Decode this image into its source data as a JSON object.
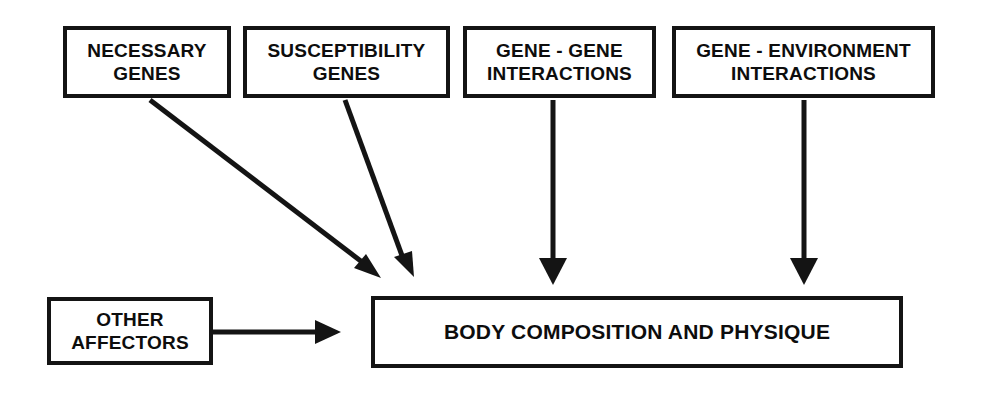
{
  "diagram": {
    "colors": {
      "stroke": "#141414",
      "text": "#0d0d0d",
      "background": "#ffffff"
    },
    "nodes": {
      "necessary_genes": {
        "label": "NECESSARY\nGENES"
      },
      "susceptibility_genes": {
        "label": "SUSCEPTIBILITY\nGENES"
      },
      "gene_gene_interactions": {
        "label": "GENE - GENE\nINTERACTIONS"
      },
      "gene_environment_interactions": {
        "label": "GENE - ENVIRONMENT\nINTERACTIONS"
      },
      "other_affectors": {
        "label": "OTHER\nAFFECTORS"
      },
      "body_composition": {
        "label": "BODY COMPOSITION AND PHYSIQUE"
      }
    },
    "edges": [
      {
        "name": "necessary-genes-to-body-composition",
        "from": "necessary_genes",
        "to": "body_composition",
        "style": "diagonal-arrow"
      },
      {
        "name": "susceptibility-genes-to-body-composition",
        "from": "susceptibility_genes",
        "to": "body_composition",
        "style": "diagonal-arrow"
      },
      {
        "name": "gene-gene-to-body-composition",
        "from": "gene_gene_interactions",
        "to": "body_composition",
        "style": "vertical-arrow"
      },
      {
        "name": "gene-environment-to-body-composition",
        "from": "gene_environment_interactions",
        "to": "body_composition",
        "style": "vertical-arrow"
      },
      {
        "name": "other-affectors-to-body-composition",
        "from": "other_affectors",
        "to": "body_composition",
        "style": "horizontal-arrow"
      }
    ]
  }
}
